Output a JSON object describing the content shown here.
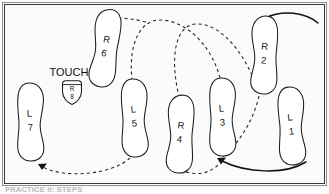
{
  "figure": {
    "caption_fragment": "PRACTICE II: STEPS",
    "border_color": "#3a3a3a",
    "line_color": "#1d1d1d",
    "background_color": "#ffffff"
  },
  "annotations": {
    "touch_label": "TOUCH"
  },
  "badge": {
    "foot": "R",
    "number": "8",
    "shape": "shield"
  },
  "footprints": [
    {
      "id": "L1",
      "foot": "L",
      "number": "1",
      "side": "left",
      "x": 291,
      "y": 126
    },
    {
      "id": "R2",
      "foot": "R",
      "number": "2",
      "side": "right",
      "x": 264,
      "y": 55
    },
    {
      "id": "L3",
      "foot": "L",
      "number": "3",
      "side": "left",
      "x": 222,
      "y": 117
    },
    {
      "id": "R4",
      "foot": "R",
      "number": "4",
      "side": "right",
      "x": 180,
      "y": 134
    },
    {
      "id": "L5",
      "foot": "L",
      "number": "5",
      "side": "left",
      "x": 134,
      "y": 118
    },
    {
      "id": "R6",
      "foot": "R",
      "number": "6",
      "side": "right",
      "x": 105,
      "y": 48
    },
    {
      "id": "L7",
      "foot": "L",
      "number": "7",
      "side": "left",
      "x": 30,
      "y": 122
    },
    {
      "id": "R8",
      "foot": "R",
      "number": "8",
      "side": "right",
      "x": 72,
      "y": 90
    }
  ],
  "paths": [
    {
      "id": "entry-arc",
      "style": "solid",
      "from": "off-right-top",
      "to": "R2",
      "arrow": "end"
    },
    {
      "id": "l1-to-l3-arc",
      "style": "solid",
      "from": "L1",
      "to": "L3",
      "arrow": "end"
    },
    {
      "id": "r2-to-r4-arc",
      "style": "dashed",
      "from": "R2",
      "to": "R4",
      "arrow": "end"
    },
    {
      "id": "l3-to-r4-arc",
      "style": "dashed",
      "from": "L3",
      "to": "R4",
      "arrow": "none"
    },
    {
      "id": "l5-to-r6-arc",
      "style": "dashed",
      "from": "L5",
      "to": "R6",
      "arrow": "end"
    },
    {
      "id": "l5-to-l7-arc",
      "style": "dashed",
      "from": "L5",
      "to": "L7",
      "arrow": "end"
    }
  ]
}
